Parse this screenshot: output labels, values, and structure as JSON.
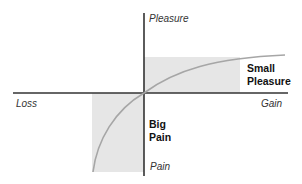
{
  "diagram": {
    "title": "",
    "axes": {
      "y_top": "Pleasure",
      "y_bottom": "Pain",
      "x_left": "Loss",
      "x_right": "Gain"
    },
    "annotations": {
      "upper_right": [
        "Small",
        "Pleasure"
      ],
      "lower_left": [
        "Big",
        "Pain"
      ]
    },
    "colors": {
      "axis": "#333333",
      "curve": "#a6a6a6",
      "shade": "#e6e6e6"
    }
  }
}
